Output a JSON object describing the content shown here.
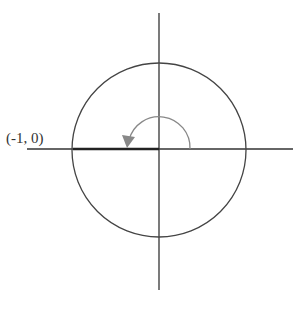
{
  "diagram": {
    "type": "unit-circle",
    "point_label": "(-1, 0)",
    "angle_arc": {
      "from_deg": 0,
      "to_deg": 180,
      "direction": "counterclockwise"
    },
    "colors": {
      "axes": "#333333",
      "circle": "#444444",
      "radius": "#222222",
      "arc": "#888888"
    }
  }
}
